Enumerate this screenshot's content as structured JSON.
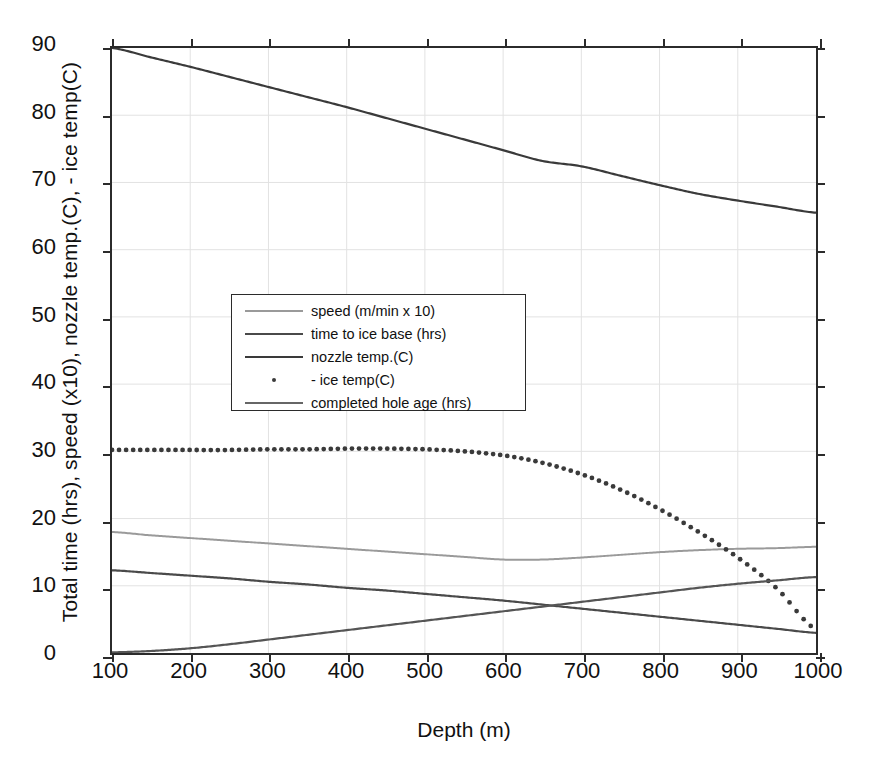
{
  "chart_data": {
    "type": "line",
    "title": "",
    "xlabel": "Depth (m)",
    "ylabel": "Total time (hrs), speed (x10), nozzle temp.(C), - ice temp(C)",
    "xlim": [
      100,
      1000
    ],
    "ylim": [
      0,
      90
    ],
    "xticks": [
      100,
      200,
      300,
      400,
      500,
      600,
      700,
      800,
      900,
      1000
    ],
    "yticks": [
      0,
      10,
      20,
      30,
      40,
      50,
      60,
      70,
      80,
      90
    ],
    "grid": true,
    "legend_position": "center-left",
    "x": [
      100,
      150,
      200,
      250,
      300,
      350,
      400,
      450,
      500,
      550,
      600,
      650,
      700,
      750,
      800,
      850,
      900,
      950,
      1000
    ],
    "series": [
      {
        "name": "speed (m/min x 10)",
        "label": "speed (m/min x 10)",
        "style": "solid",
        "color": "#9a9a9a",
        "width": 2.0,
        "values": [
          18.0,
          17.5,
          17.1,
          16.7,
          16.3,
          15.9,
          15.5,
          15.1,
          14.7,
          14.3,
          13.9,
          13.9,
          14.2,
          14.6,
          15.0,
          15.3,
          15.5,
          15.6,
          15.8
        ]
      },
      {
        "name": "time to ice base (hrs)",
        "label": "time to ice base (hrs)",
        "style": "solid",
        "color": "#4a4a4a",
        "width": 2.2,
        "values": [
          12.3,
          11.9,
          11.5,
          11.1,
          10.6,
          10.2,
          9.7,
          9.3,
          8.8,
          8.3,
          7.8,
          7.2,
          6.6,
          6.0,
          5.4,
          4.8,
          4.2,
          3.6,
          3.0
        ]
      },
      {
        "name": "nozzle temp.(C)",
        "label": "nozzle temp.(C)",
        "style": "solid",
        "color": "#3a3a3a",
        "width": 2.2,
        "values": [
          90.0,
          88.6,
          87.2,
          85.7,
          84.2,
          82.7,
          81.2,
          79.6,
          78.0,
          76.4,
          74.8,
          73.2,
          72.4,
          71.0,
          69.6,
          68.3,
          67.3,
          66.4,
          65.5
        ]
      },
      {
        "name": "- ice temp(C)",
        "label": "- ice temp(C)",
        "style": "dotted",
        "color": "#3a3a3a",
        "width": 4.4,
        "values": [
          30.2,
          30.2,
          30.2,
          30.2,
          30.3,
          30.3,
          30.4,
          30.4,
          30.3,
          30.0,
          29.4,
          28.3,
          26.6,
          24.3,
          21.4,
          18.0,
          14.2,
          9.6,
          3.5
        ]
      },
      {
        "name": "completed hole age (hrs)",
        "label": "completed hole age (hrs)",
        "style": "solid",
        "color": "#555555",
        "width": 2.2,
        "values": [
          0.1,
          0.3,
          0.7,
          1.3,
          2.0,
          2.7,
          3.4,
          4.1,
          4.8,
          5.5,
          6.2,
          6.9,
          7.6,
          8.3,
          9.0,
          9.7,
          10.3,
          10.8,
          11.3
        ]
      }
    ]
  },
  "axes": {
    "x_label": "Depth (m)",
    "y_label": "Total time (hrs), speed (x10), nozzle temp.(C), - ice temp(C)",
    "x_tick_labels": [
      "100",
      "200",
      "300",
      "400",
      "500",
      "600",
      "700",
      "800",
      "900",
      "1000"
    ],
    "y_tick_labels": [
      "0",
      "10",
      "20",
      "30",
      "40",
      "50",
      "60",
      "70",
      "80",
      "90"
    ]
  },
  "legend": {
    "entries": [
      {
        "label": "speed (m/min x 10)",
        "style": "solid",
        "color": "#9a9a9a"
      },
      {
        "label": "time to ice base (hrs)",
        "style": "solid",
        "color": "#4a4a4a"
      },
      {
        "label": "nozzle temp.(C)",
        "style": "solid",
        "color": "#3a3a3a"
      },
      {
        "label": "- ice temp(C)",
        "style": "dotted",
        "color": "#3a3a3a"
      },
      {
        "label": "completed hole age (hrs)",
        "style": "solid",
        "color": "#666666"
      }
    ]
  },
  "colors": {
    "axis": "#2b2b2b",
    "grid": "#e2e2e2",
    "background": "#ffffff",
    "text": "#111111"
  }
}
